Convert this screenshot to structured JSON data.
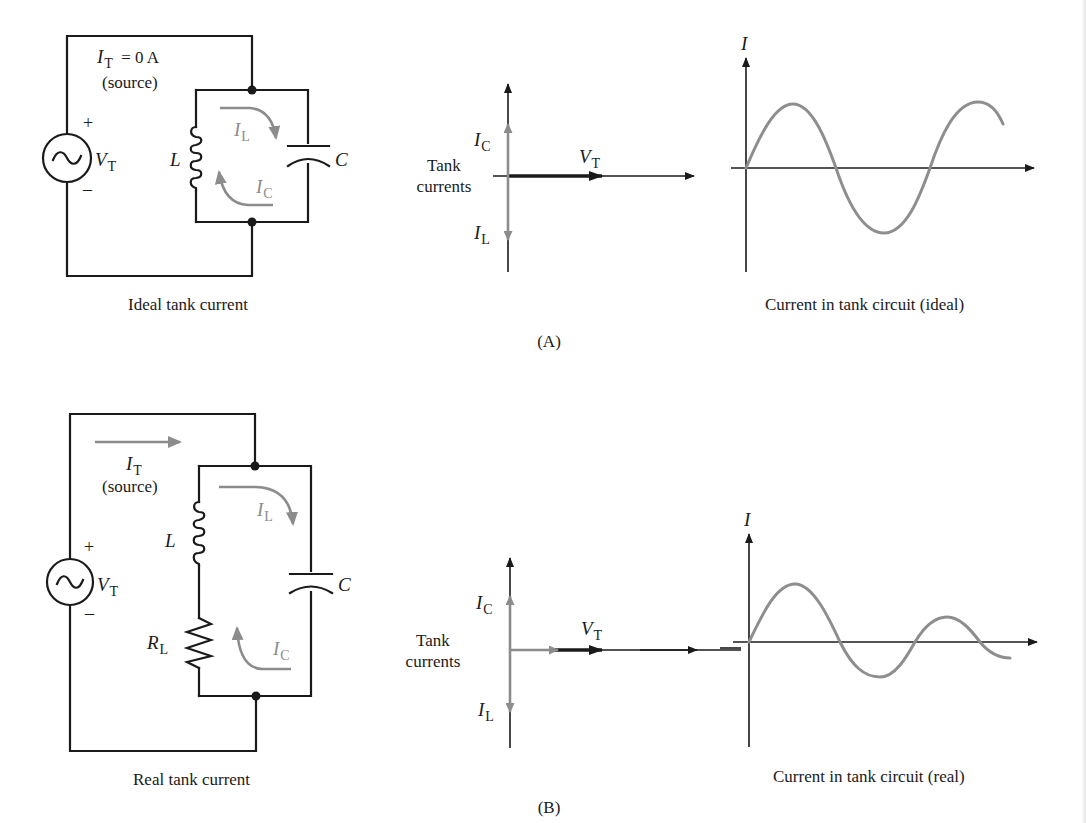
{
  "panels": {
    "A": {
      "tag": "(A)",
      "circuit": {
        "caption": "Ideal tank current",
        "source_current": {
          "symbol": "I",
          "sub": "T",
          "value": "= 0 A",
          "note": "(source)"
        },
        "source_voltage": {
          "symbol": "V",
          "sub": "T",
          "plus": "+",
          "minus": "–"
        },
        "inductor": {
          "symbol": "L"
        },
        "capacitor": {
          "symbol": "C"
        },
        "loop_currents": {
          "IL": {
            "symbol": "I",
            "sub": "L"
          },
          "IC": {
            "symbol": "I",
            "sub": "C"
          }
        }
      },
      "phasor": {
        "side_label_line1": "Tank",
        "side_label_line2": "currents",
        "IC": {
          "symbol": "I",
          "sub": "C"
        },
        "IL": {
          "symbol": "I",
          "sub": "L"
        },
        "VT": {
          "symbol": "V",
          "sub": "T"
        }
      },
      "waveform": {
        "axis_label": "I",
        "caption": "Current in tank circuit (ideal)"
      }
    },
    "B": {
      "tag": "(B)",
      "circuit": {
        "caption": "Real tank current",
        "source_current": {
          "symbol": "I",
          "sub": "T",
          "note": "(source)"
        },
        "source_voltage": {
          "symbol": "V",
          "sub": "T",
          "plus": "+",
          "minus": "–"
        },
        "inductor": {
          "symbol": "L"
        },
        "resistor": {
          "symbol": "R",
          "sub": "L"
        },
        "capacitor": {
          "symbol": "C"
        },
        "loop_currents": {
          "IL": {
            "symbol": "I",
            "sub": "L"
          },
          "IC": {
            "symbol": "I",
            "sub": "C"
          }
        }
      },
      "phasor": {
        "side_label_line1": "Tank",
        "side_label_line2": "currents",
        "IC": {
          "symbol": "I",
          "sub": "C"
        },
        "IL": {
          "symbol": "I",
          "sub": "L"
        },
        "VT": {
          "symbol": "V",
          "sub": "T"
        }
      },
      "waveform": {
        "axis_label": "I",
        "caption": "Current in tank circuit (real)"
      }
    }
  },
  "colors": {
    "line": "#1a1a1a",
    "current_arrow": "#8c8c8c",
    "waveform": "#8e8e8e",
    "background": "#ffffff"
  }
}
